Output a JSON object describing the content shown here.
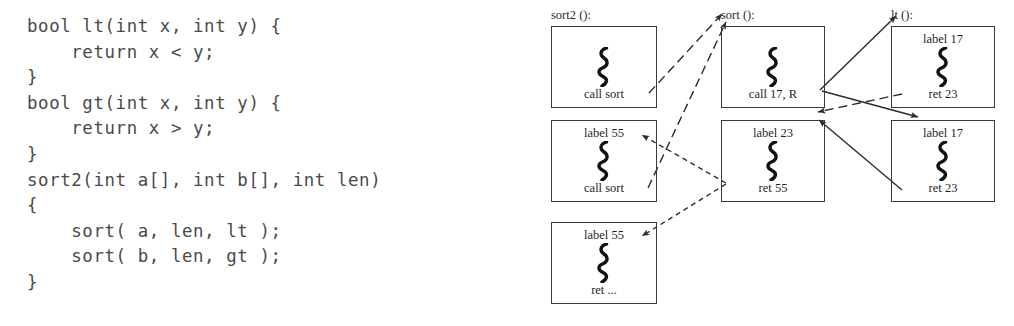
{
  "code": {
    "language": "c",
    "listing": "bool lt(int x, int y) {\n    return x < y;\n}\nbool gt(int x, int y) {\n    return x > y;\n}\nsort2(int a[], int b[], int len)\n{\n    sort( a, len, lt );\n    sort( b, len, gt );\n}"
  },
  "diagram": {
    "type": "control-flow-trace",
    "columns": [
      {
        "id": "sort2",
        "header": "sort2 ():"
      },
      {
        "id": "sort",
        "header": "sort ():"
      },
      {
        "id": "lt",
        "header": "lt ():"
      }
    ],
    "frames": [
      {
        "id": "sort2-1",
        "column": "sort2",
        "top_label": "",
        "icon": "code-squiggle-icon",
        "bottom_label": "call sort"
      },
      {
        "id": "sort2-2",
        "column": "sort2",
        "top_label": "label 55",
        "icon": "code-squiggle-icon",
        "bottom_label": "call sort"
      },
      {
        "id": "sort2-3",
        "column": "sort2",
        "top_label": "label 55",
        "icon": "code-squiggle-icon",
        "bottom_label": "ret ..."
      },
      {
        "id": "sort-1",
        "column": "sort",
        "top_label": "",
        "icon": "code-squiggle-icon",
        "bottom_label": "call 17, R"
      },
      {
        "id": "sort-2",
        "column": "sort",
        "top_label": "label 23",
        "icon": "code-squiggle-icon",
        "bottom_label": "ret 55"
      },
      {
        "id": "lt-1",
        "column": "lt",
        "top_label": "label 17",
        "icon": "code-squiggle-icon",
        "bottom_label": "ret 23"
      },
      {
        "id": "lt-2",
        "column": "lt",
        "top_label": "label 17",
        "icon": "code-squiggle-icon",
        "bottom_label": "ret 23"
      }
    ],
    "edges": [
      {
        "from": "sort2-1 call sort",
        "to": "sort-1 top",
        "style": "dashed",
        "direction": "up-right"
      },
      {
        "from": "sort2-2 call sort",
        "to": "sort-1 top",
        "style": "dashed",
        "direction": "up-right"
      },
      {
        "from": "sort-1 call 17, R",
        "to": "lt-1 label 17",
        "style": "solid",
        "direction": "up-right"
      },
      {
        "from": "sort-1 call 17, R",
        "to": "lt-2 label 17",
        "style": "solid",
        "direction": "down-right"
      },
      {
        "from": "lt-1 ret 23",
        "to": "sort-2 label 23",
        "style": "dashed",
        "direction": "down-left"
      },
      {
        "from": "lt-2 ret 23",
        "to": "sort-2 label 23",
        "style": "solid",
        "direction": "up-left"
      },
      {
        "from": "sort-2 ret 55",
        "to": "sort2-2 label 55",
        "style": "dotted",
        "direction": "up-left"
      },
      {
        "from": "sort-2 ret 55",
        "to": "sort2-3 label 55",
        "style": "dotted",
        "direction": "down-left"
      }
    ],
    "colors": {
      "stroke": "#2b2b2b",
      "box_border": "#3a3a3a",
      "text": "#1f1f1f",
      "background": "#ffffff"
    }
  }
}
